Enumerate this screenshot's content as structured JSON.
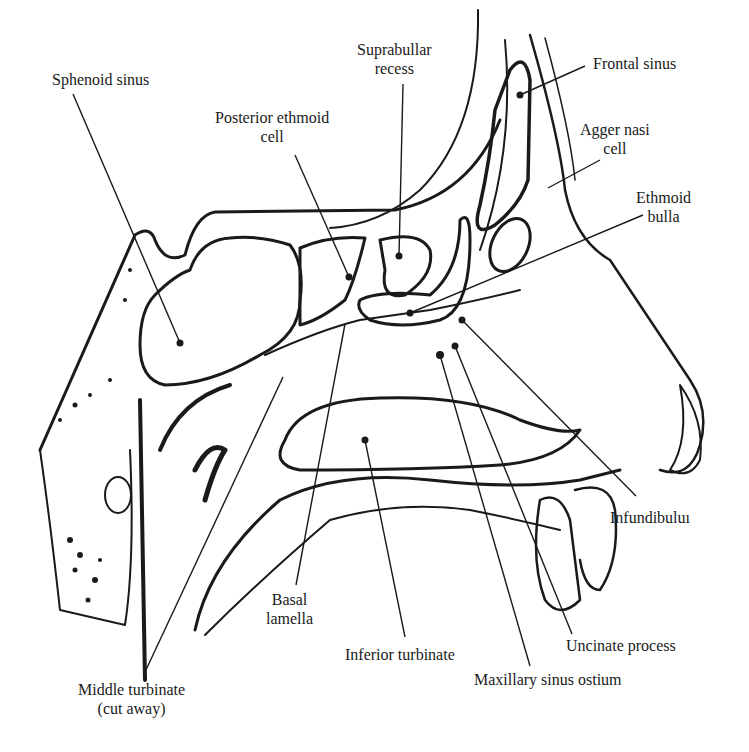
{
  "diagram": {
    "type": "anatomical-illustration",
    "labels": [
      {
        "id": "sphenoid-sinus",
        "text_lines": [
          "Sphenoid sinus"
        ],
        "x": 52,
        "y": 70,
        "pointer": {
          "x1": 73,
          "y1": 94,
          "x2": 180,
          "y2": 343
        }
      },
      {
        "id": "posterior-ethmoid-cell",
        "text_lines": [
          "Posterior ethmoid",
          "cell"
        ],
        "x": 215,
        "y": 108,
        "pointer": {
          "x1": 295,
          "y1": 155,
          "x2": 349,
          "y2": 277
        }
      },
      {
        "id": "suprabullar-recess",
        "text_lines": [
          "Suprabullar",
          "recess"
        ],
        "x": 357,
        "y": 40,
        "pointer": {
          "x1": 403,
          "y1": 84,
          "x2": 399,
          "y2": 256
        }
      },
      {
        "id": "frontal-sinus",
        "text_lines": [
          "Frontal sinus"
        ],
        "x": 593,
        "y": 54,
        "pointer": {
          "x1": 585,
          "y1": 66,
          "x2": 520,
          "y2": 95
        }
      },
      {
        "id": "agger-nasi-cell",
        "text_lines": [
          "Agger nasi",
          "cell"
        ],
        "x": 580,
        "y": 120,
        "pointer": {
          "x1": 600,
          "y1": 160,
          "x2": 548,
          "y2": 188
        }
      },
      {
        "id": "ethmoid-bulla",
        "text_lines": [
          "Ethmoid",
          "bulla"
        ],
        "x": 636,
        "y": 188,
        "pointer": {
          "x1": 643,
          "y1": 215,
          "x2": 410,
          "y2": 313
        }
      },
      {
        "id": "infundibulum",
        "text_lines": [
          "Infundibuluı"
        ],
        "x": 610,
        "y": 508,
        "pointer": {
          "x1": 636,
          "y1": 496,
          "x2": 462,
          "y2": 320
        }
      },
      {
        "id": "uncinate-process",
        "text_lines": [
          "Uncinate process"
        ],
        "x": 566,
        "y": 636,
        "pointer": {
          "x1": 572,
          "y1": 634,
          "x2": 455,
          "y2": 346
        }
      },
      {
        "id": "maxillary-sinus-ostium",
        "text_lines": [
          "Maxillary sinus ostium"
        ],
        "x": 474,
        "y": 670,
        "pointer": {
          "x1": 530,
          "y1": 666,
          "x2": 440,
          "y2": 355
        }
      },
      {
        "id": "inferior-turbinate",
        "text_lines": [
          "Inferior turbinate"
        ],
        "x": 345,
        "y": 645,
        "pointer": {
          "x1": 405,
          "y1": 637,
          "x2": 365,
          "y2": 440
        }
      },
      {
        "id": "basal-lamella",
        "text_lines": [
          "Basal",
          "lamella"
        ],
        "x": 266,
        "y": 590,
        "pointer": {
          "x1": 296,
          "y1": 585,
          "x2": 345,
          "y2": 324
        }
      },
      {
        "id": "middle-turbinate",
        "text_lines": [
          "Middle turbinate",
          "(cut away)"
        ],
        "x": 78,
        "y": 680,
        "pointer": {
          "x1": 145,
          "y1": 672,
          "x2": 283,
          "y2": 377
        }
      }
    ],
    "caption_partial": "(faint, cut-off figure caption at bottom edge)"
  }
}
